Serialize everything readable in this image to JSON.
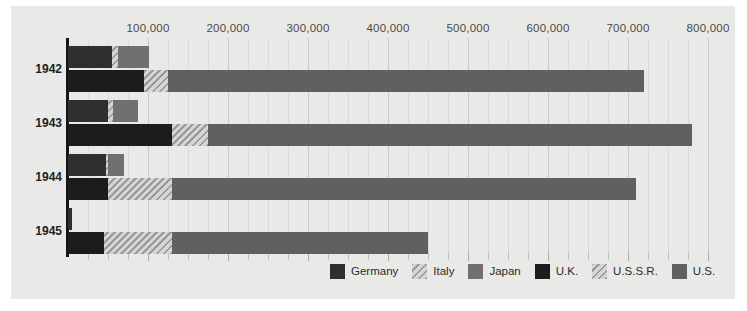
{
  "chart_data": {
    "type": "bar",
    "orientation": "horizontal",
    "stacked": true,
    "title": "",
    "subtitle": "",
    "xlabel": "",
    "ylabel": "",
    "xlim": [
      0,
      820000
    ],
    "ylim": [
      0,
      4
    ],
    "grid": true,
    "grid_axis": "x",
    "major_tick_interval": 100000,
    "minor_tick_interval": 25000,
    "legend_position": "bottom-right",
    "categories": [
      "1942",
      "1943",
      "1944",
      "1945"
    ],
    "tick_values": [
      100000,
      200000,
      300000,
      400000,
      500000,
      600000,
      700000,
      800000
    ],
    "tick_labels": [
      "100,000",
      "200,000",
      "300,000",
      "400,000",
      "500,000",
      "600,000",
      "700,000",
      "800,000"
    ],
    "groups": [
      {
        "name": "Axis",
        "series_names": [
          "Germany",
          "Italy",
          "Japan"
        ]
      },
      {
        "name": "Allies",
        "series_names": [
          "U.K.",
          "U.S.S.R.",
          "U.S."
        ]
      }
    ],
    "series": [
      {
        "name": "Germany",
        "key": "germany",
        "color": "#2f2f2f",
        "pattern": "solid",
        "group": "Axis",
        "values": [
          55000,
          50000,
          48000,
          5000
        ]
      },
      {
        "name": "Italy",
        "key": "italy",
        "color": "#b9b9b7",
        "pattern": "hatch",
        "group": "Axis",
        "values": [
          8000,
          6000,
          2000,
          0
        ]
      },
      {
        "name": "Japan",
        "key": "japan",
        "color": "#707070",
        "pattern": "solid",
        "group": "Axis",
        "values": [
          38000,
          32000,
          20000,
          0
        ]
      },
      {
        "name": "U.K.",
        "key": "uk",
        "color": "#1c1c1c",
        "pattern": "solid",
        "group": "Allies",
        "values": [
          95000,
          130000,
          50000,
          45000
        ]
      },
      {
        "name": "U.S.S.R.",
        "key": "ussr",
        "color": "#b9b9b7",
        "pattern": "hatch",
        "group": "Allies",
        "values": [
          30000,
          45000,
          80000,
          85000
        ]
      },
      {
        "name": "U.S.",
        "key": "us",
        "color": "#606060",
        "pattern": "solid",
        "group": "Allies",
        "values": [
          595000,
          605000,
          580000,
          320000
        ]
      }
    ],
    "bars": [
      {
        "category": "1942",
        "rows": [
          {
            "group": "Axis",
            "segments": [
              {
                "series": "Germany",
                "value": 55000
              },
              {
                "series": "Italy",
                "value": 8000
              },
              {
                "series": "Japan",
                "value": 38000
              }
            ]
          },
          {
            "group": "Allies",
            "segments": [
              {
                "series": "U.K.",
                "value": 95000
              },
              {
                "series": "U.S.S.R.",
                "value": 30000
              },
              {
                "series": "U.S.",
                "value": 595000
              }
            ]
          }
        ]
      },
      {
        "category": "1943",
        "rows": [
          {
            "group": "Axis",
            "segments": [
              {
                "series": "Germany",
                "value": 50000
              },
              {
                "series": "Italy",
                "value": 6000
              },
              {
                "series": "Japan",
                "value": 32000
              }
            ]
          },
          {
            "group": "Allies",
            "segments": [
              {
                "series": "U.K.",
                "value": 130000
              },
              {
                "series": "U.S.S.R.",
                "value": 45000
              },
              {
                "series": "U.S.",
                "value": 605000
              }
            ]
          }
        ]
      },
      {
        "category": "1944",
        "rows": [
          {
            "group": "Axis",
            "segments": [
              {
                "series": "Germany",
                "value": 48000
              },
              {
                "series": "Italy",
                "value": 2000
              },
              {
                "series": "Japan",
                "value": 20000
              }
            ]
          },
          {
            "group": "Allies",
            "segments": [
              {
                "series": "U.K.",
                "value": 50000
              },
              {
                "series": "U.S.S.R.",
                "value": 80000
              },
              {
                "series": "U.S.",
                "value": 580000
              }
            ]
          }
        ]
      },
      {
        "category": "1945",
        "rows": [
          {
            "group": "Axis",
            "segments": [
              {
                "series": "Germany",
                "value": 5000
              },
              {
                "series": "Italy",
                "value": 0
              },
              {
                "series": "Japan",
                "value": 0
              }
            ]
          },
          {
            "group": "Allies",
            "segments": [
              {
                "series": "U.K.",
                "value": 45000
              },
              {
                "series": "U.S.S.R.",
                "value": 85000
              },
              {
                "series": "U.S.",
                "value": 320000
              }
            ]
          }
        ]
      }
    ]
  },
  "legend": {
    "items": [
      {
        "label": "Germany",
        "key": "germany",
        "color": "#2f2f2f",
        "pattern": "solid"
      },
      {
        "label": "Italy",
        "key": "italy",
        "color": "#b9b9b7",
        "pattern": "hatch"
      },
      {
        "label": "Japan",
        "key": "japan",
        "color": "#707070",
        "pattern": "solid"
      },
      {
        "label": "U.K.",
        "key": "uk",
        "color": "#1c1c1c",
        "pattern": "solid"
      },
      {
        "label": "U.S.S.R.",
        "key": "ussr",
        "color": "#b9b9b7",
        "pattern": "hatch"
      },
      {
        "label": "U.S.",
        "key": "us",
        "color": "#606060",
        "pattern": "solid"
      }
    ]
  },
  "colors": {
    "panel_background": "#e9e9e7",
    "page_background": "#ffffff",
    "axis_line": "#151515",
    "gridline_major": "#c9c9c7",
    "gridline_minor": "#dadad8",
    "tick_label": "#4a4a4a",
    "year_label": "#222222"
  }
}
